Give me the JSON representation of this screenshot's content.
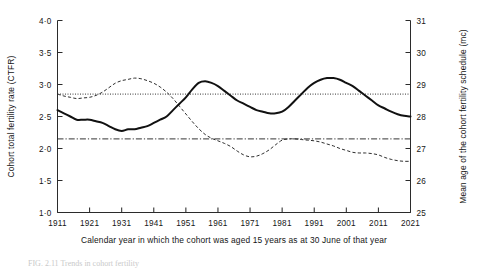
{
  "figure": {
    "caption_partial": "FIG. 2.11  Trends in cohort fertility"
  },
  "chart_data": {
    "type": "line",
    "title": "",
    "xlabel": "Calendar year in which the cohort was aged 15 years as at 30 June of that year",
    "ylabel": "Cohort total fertility rate (CTFR)",
    "y2label": "Mean age of the cohort fertility schedule (mc)",
    "grid": false,
    "legend": "none",
    "xlim": [
      1911,
      2021
    ],
    "ylim": [
      1.0,
      4.0
    ],
    "y2lim": [
      25,
      31
    ],
    "xticks": [
      1911,
      1921,
      1931,
      1941,
      1951,
      1961,
      1971,
      1981,
      1991,
      2001,
      2011,
      2021
    ],
    "xtick_labels": [
      "1911",
      "1921",
      "1931",
      "1941",
      "1951",
      "1961",
      "1971",
      "1981",
      "1991",
      "2001",
      "2011",
      "2021"
    ],
    "yticks": [
      1.0,
      1.5,
      2.0,
      2.5,
      3.0,
      3.5,
      4.0
    ],
    "ytick_labels": [
      "1·0",
      "1·5",
      "2·0",
      "2·5",
      "3·0",
      "3·5",
      "4·0"
    ],
    "y2ticks": [
      25,
      26,
      27,
      28,
      29,
      30,
      31
    ],
    "y2tick_labels": [
      "25",
      "26",
      "27",
      "28",
      "29",
      "30",
      "31"
    ],
    "series": [
      {
        "name": "Cohort total fertility rate (CTFR)",
        "style": "dashed",
        "axis": "left",
        "x": [
          1911,
          1913,
          1915,
          1917,
          1919,
          1921,
          1923,
          1925,
          1927,
          1929,
          1931,
          1933,
          1935,
          1937,
          1939,
          1941,
          1943,
          1945,
          1947,
          1949,
          1951,
          1953,
          1955,
          1957,
          1959,
          1961,
          1963,
          1965,
          1967,
          1969,
          1971,
          1973,
          1975,
          1977,
          1979,
          1981,
          1983,
          1985,
          1987,
          1989,
          1991,
          1993,
          1995,
          1997,
          1999,
          2001,
          2003,
          2005,
          2007,
          2009,
          2011,
          2013,
          2015,
          2017,
          2019,
          2021
        ],
        "y": [
          2.85,
          2.82,
          2.8,
          2.78,
          2.79,
          2.8,
          2.83,
          2.88,
          2.95,
          3.02,
          3.06,
          3.08,
          3.1,
          3.09,
          3.06,
          3.02,
          2.96,
          2.88,
          2.78,
          2.66,
          2.54,
          2.42,
          2.31,
          2.22,
          2.16,
          2.12,
          2.08,
          2.03,
          1.96,
          1.9,
          1.87,
          1.88,
          1.92,
          1.98,
          2.06,
          2.13,
          2.15,
          2.15,
          2.14,
          2.13,
          2.12,
          2.1,
          2.07,
          2.04,
          2.0,
          1.97,
          1.94,
          1.93,
          1.93,
          1.92,
          1.9,
          1.86,
          1.83,
          1.81,
          1.8,
          1.8
        ]
      },
      {
        "name": "Mean age of the cohort fertility schedule (mc)",
        "style": "solid",
        "axis": "right",
        "x": [
          1911,
          1913,
          1915,
          1917,
          1919,
          1921,
          1923,
          1925,
          1927,
          1929,
          1931,
          1933,
          1935,
          1937,
          1939,
          1941,
          1943,
          1945,
          1947,
          1949,
          1951,
          1953,
          1955,
          1957,
          1959,
          1961,
          1963,
          1965,
          1967,
          1969,
          1971,
          1973,
          1975,
          1977,
          1979,
          1981,
          1983,
          1985,
          1987,
          1989,
          1991,
          1993,
          1995,
          1997,
          1999,
          2001,
          2003,
          2005,
          2007,
          2009,
          2011,
          2013,
          2015,
          2017,
          2019,
          2021
        ],
        "y": [
          28.2,
          28.1,
          28.0,
          27.9,
          27.9,
          27.9,
          27.85,
          27.8,
          27.7,
          27.6,
          27.55,
          27.6,
          27.6,
          27.65,
          27.7,
          27.8,
          27.9,
          28.0,
          28.2,
          28.4,
          28.6,
          28.85,
          29.05,
          29.1,
          29.05,
          28.95,
          28.8,
          28.65,
          28.5,
          28.4,
          28.3,
          28.2,
          28.15,
          28.1,
          28.1,
          28.15,
          28.3,
          28.5,
          28.7,
          28.9,
          29.05,
          29.15,
          29.2,
          29.2,
          29.15,
          29.05,
          28.95,
          28.8,
          28.65,
          28.5,
          28.35,
          28.25,
          28.15,
          28.07,
          28.02,
          28.0
        ]
      },
      {
        "name": "CTFR reference level",
        "style": "dashdot",
        "axis": "left",
        "x": [
          1911,
          2021
        ],
        "y": [
          2.15,
          2.15
        ]
      },
      {
        "name": "Mean age reference level",
        "style": "dotted",
        "axis": "right",
        "x": [
          1911,
          2021
        ],
        "y": [
          28.7,
          28.7
        ]
      }
    ]
  }
}
